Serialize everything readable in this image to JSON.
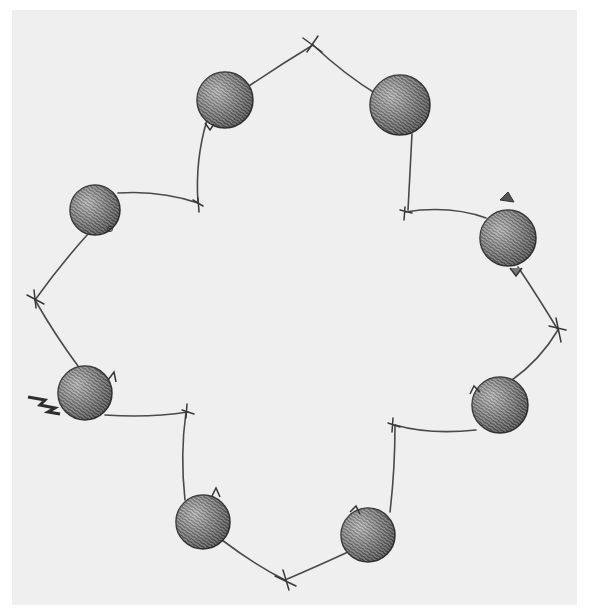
{
  "illustration": {
    "description": "Hand-drawn sketch of eight textured seed-pod balls on stems connected into a four-lobed ring",
    "background": "#efefef",
    "ink_color": "#3a3a3a",
    "pod_count": 8,
    "pods": [
      {
        "id": "top-left",
        "cx": 225,
        "cy": 100,
        "r": 28
      },
      {
        "id": "top-right",
        "cx": 400,
        "cy": 105,
        "r": 30
      },
      {
        "id": "left",
        "cx": 95,
        "cy": 210,
        "r": 25
      },
      {
        "id": "right",
        "cx": 508,
        "cy": 238,
        "r": 28
      },
      {
        "id": "lower-left",
        "cx": 85,
        "cy": 393,
        "r": 27
      },
      {
        "id": "lower-right",
        "cx": 500,
        "cy": 405,
        "r": 28
      },
      {
        "id": "bottom-left",
        "cx": 203,
        "cy": 522,
        "r": 27
      },
      {
        "id": "bottom-right",
        "cx": 368,
        "cy": 535,
        "r": 27
      }
    ],
    "joints": [
      {
        "id": "top",
        "x": 313,
        "y": 45
      },
      {
        "id": "left",
        "x": 35,
        "y": 300
      },
      {
        "id": "right",
        "x": 558,
        "y": 330
      },
      {
        "id": "bottom",
        "x": 285,
        "y": 580
      }
    ]
  }
}
